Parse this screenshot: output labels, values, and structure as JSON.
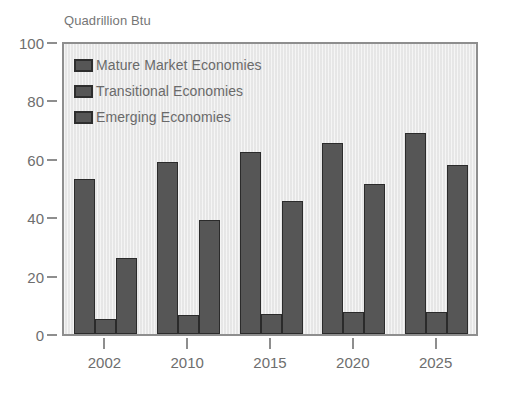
{
  "chart_data": {
    "type": "bar",
    "title": "Quadrillion Btu",
    "xlabel": "",
    "ylabel": "Quadrillion Btu",
    "categories": [
      "2002",
      "2010",
      "2015",
      "2020",
      "2025"
    ],
    "series": [
      {
        "name": "Mature Market Economies",
        "values": [
          53,
          59,
          62.5,
          65.5,
          69
        ],
        "color": "#565656"
      },
      {
        "name": "Transitional Economies",
        "values": [
          5,
          6.5,
          7,
          7.5,
          7.5
        ],
        "color": "#565656"
      },
      {
        "name": "Emerging Economies",
        "values": [
          26,
          39,
          45.5,
          51.5,
          58
        ],
        "color": "#565656"
      }
    ],
    "ylim": [
      0,
      100
    ],
    "yticks": [
      0,
      20,
      40,
      60,
      80,
      100
    ],
    "ytick_labels": [
      "0",
      "20",
      "40",
      "60",
      "80",
      "100"
    ],
    "grid": false,
    "legend_position": "top-left",
    "plot_background": "#e9e9e9",
    "axis_color": "#8e8e8e",
    "text_color": "#6e6e6e"
  },
  "legend": {
    "items": [
      {
        "label": "Mature Market Economies"
      },
      {
        "label": "Transitional Economies"
      },
      {
        "label": "Emerging Economies"
      }
    ]
  }
}
